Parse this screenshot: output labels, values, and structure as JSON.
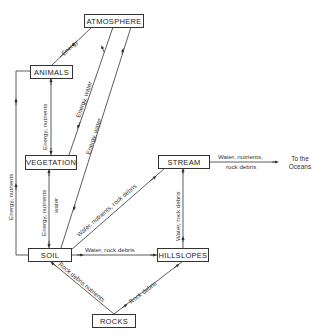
{
  "diagram": {
    "type": "flow",
    "nodes": {
      "atmosphere": "ATMOSPHERE",
      "animals": "ANIMALS",
      "vegetation": "VEGETATION",
      "stream": "STREAM",
      "soil": "SOIL",
      "hillslopes": "HILLSLOPES",
      "rocks": "ROCKS"
    },
    "external": {
      "oceans_line1": "To the",
      "oceans_line2": "Oceans"
    },
    "edges": {
      "animals_atmosphere": "Energy",
      "vegetation_animals": "Energy, nutrients",
      "atmosphere_vegetation": "Energy, water",
      "atmosphere_soil": "Energy, water",
      "animals_soil": "Energy, nutrients",
      "soil_vegetation_line1": "Energy, nutrients",
      "soil_vegetation_line2": "water",
      "soil_stream": "Water, nutrients, rock debris",
      "soil_hillslopes": "Water, rock debris",
      "hillslopes_stream": "Water, rock debris",
      "stream_oceans_line1": "Water, nutrients,",
      "stream_oceans_line2": "rock debris",
      "rocks_soil": "Rock debris nutrients",
      "rocks_hillslopes": "Rock debris"
    }
  }
}
